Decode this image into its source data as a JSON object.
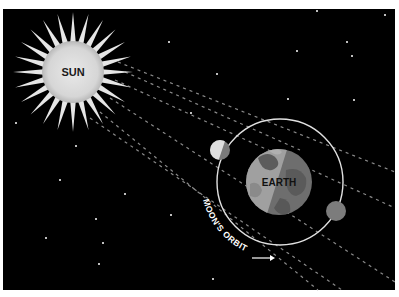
{
  "diagram": {
    "background": "#000000",
    "border_color": "#ffffff",
    "labels": {
      "sun": "SUN",
      "earth": "EARTH",
      "moon_orbit": "MOON'S ORBIT"
    },
    "sun": {
      "cx": 73,
      "cy": 72,
      "disk_r": 31,
      "ray_outer_r": 60,
      "ray_count": 24,
      "disk_color": "#d9d9d9",
      "ray_color": "#e6e6e6"
    },
    "earth": {
      "cx": 279,
      "cy": 182,
      "r": 33,
      "lit_color": "#9a9a9a",
      "dark_color": "#6e6e6e"
    },
    "orbit": {
      "cx": 280,
      "cy": 182,
      "r": 63,
      "color": "#e0e0e0"
    },
    "moons": [
      {
        "name": "moon-left",
        "cx": 220,
        "cy": 150,
        "r": 10
      },
      {
        "name": "moon-right",
        "cx": 336,
        "cy": 211,
        "r": 10
      }
    ],
    "stars": [
      [
        317,
        11
      ],
      [
        385,
        15
      ],
      [
        169,
        42
      ],
      [
        347,
        42
      ],
      [
        297,
        51
      ],
      [
        352,
        56
      ],
      [
        217,
        74
      ],
      [
        288,
        99
      ],
      [
        354,
        100
      ],
      [
        191,
        113
      ],
      [
        16,
        123
      ],
      [
        76,
        146
      ],
      [
        60,
        180
      ],
      [
        125,
        194
      ],
      [
        96,
        219
      ],
      [
        171,
        215
      ],
      [
        46,
        238
      ],
      [
        103,
        243
      ],
      [
        99,
        264
      ],
      [
        213,
        279
      ]
    ]
  }
}
